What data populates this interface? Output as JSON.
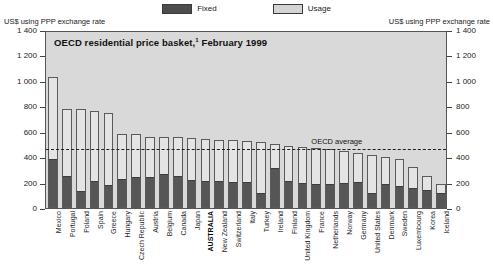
{
  "legend": {
    "entries": [
      {
        "key": "fixed",
        "label": "Fixed",
        "color": "#565656"
      },
      {
        "key": "usage",
        "label": "Usage",
        "color": "#e4e4e4"
      }
    ]
  },
  "axis_caption_left": "US$ using PPP exchange rate",
  "axis_caption_right": "US$ using PPP exchange rate",
  "title": "OECD residential price basket,",
  "title_footnote": "1",
  "title_date": " February 1999",
  "average_label": "OECD average",
  "chart_data": {
    "type": "bar",
    "title": "OECD residential price basket,1 February 1999",
    "subtitle": "",
    "xlabel": "",
    "ylabel": "US$ using PPP exchange rate",
    "ylabel_right": "US$ using PPP exchange rate",
    "ylim": [
      0,
      1400
    ],
    "yticks": [
      0,
      200,
      400,
      600,
      800,
      1000,
      1200,
      1400
    ],
    "ytick_labels": [
      "0",
      "200",
      "400",
      "600",
      "800",
      "1 000",
      "1 200",
      "1 400"
    ],
    "grid": false,
    "legend_position": "top-center",
    "stacked": true,
    "highlight_category": "AUSTRALIA",
    "annotations": [
      {
        "type": "hline",
        "label": "OECD average",
        "value": 480,
        "style": "dashed"
      }
    ],
    "categories": [
      "Mexico",
      "Portugal",
      "Poland",
      "Spain",
      "Greece",
      "Hungary",
      "Czech Republic",
      "Austria",
      "Belgium",
      "Canada",
      "Japan",
      "AUSTRALIA",
      "New Zealand",
      "Switzerland",
      "Italy",
      "Turkey",
      "Ireland",
      "Finland",
      "United Kingdom",
      "France",
      "Netherlands",
      "Norway",
      "Germany",
      "United States",
      "Denmark",
      "Sweden",
      "Luxembourg",
      "Korea",
      "Iceland"
    ],
    "series": [
      {
        "name": "Fixed",
        "color": "#565656",
        "values": [
          370,
          235,
          120,
          200,
          165,
          215,
          225,
          230,
          250,
          235,
          205,
          200,
          195,
          185,
          185,
          105,
          300,
          200,
          180,
          175,
          170,
          180,
          190,
          100,
          170,
          160,
          145,
          125,
          100
        ]
      },
      {
        "name": "Usage",
        "color": "#e4e4e4",
        "values": [
          660,
          540,
          655,
          560,
          580,
          370,
          355,
          330,
          310,
          325,
          345,
          340,
          340,
          350,
          345,
          415,
          200,
          290,
          300,
          295,
          295,
          270,
          245,
          320,
          230,
          225,
          175,
          130,
          90
        ]
      }
    ],
    "totals": [
      1030,
      775,
      775,
      760,
      745,
      585,
      580,
      560,
      560,
      560,
      550,
      540,
      535,
      535,
      530,
      520,
      500,
      490,
      480,
      470,
      465,
      450,
      435,
      420,
      400,
      385,
      320,
      255,
      190
    ]
  }
}
